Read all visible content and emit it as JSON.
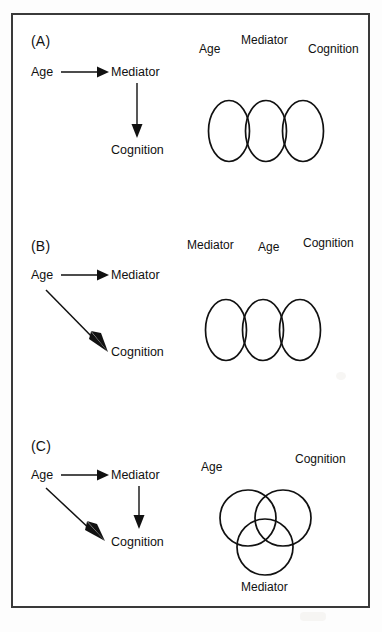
{
  "figure": {
    "panels": [
      {
        "id": "A",
        "label": "(A)",
        "path_diagram": {
          "nodes": {
            "age": "Age",
            "mediator": "Mediator",
            "cognition": "Cognition"
          },
          "arrows": [
            {
              "from": "Age",
              "to": "Mediator",
              "direction": "horizontal"
            },
            {
              "from": "Mediator",
              "to": "Cognition",
              "direction": "vertical"
            }
          ]
        },
        "venn": {
          "type": "chain-three-circle",
          "labels": [
            "Age",
            "Mediator",
            "Cognition"
          ],
          "overlaps": [
            "Age-Mediator",
            "Mediator-Cognition"
          ]
        }
      },
      {
        "id": "B",
        "label": "(B)",
        "path_diagram": {
          "nodes": {
            "age": "Age",
            "mediator": "Mediator",
            "cognition": "Cognition"
          },
          "arrows": [
            {
              "from": "Age",
              "to": "Mediator",
              "direction": "horizontal"
            },
            {
              "from": "Age",
              "to": "Cognition",
              "direction": "diagonal"
            }
          ]
        },
        "venn": {
          "type": "chain-three-circle",
          "labels": [
            "Mediator",
            "Age",
            "Cognition"
          ],
          "overlaps": [
            "Mediator-Age",
            "Age-Cognition"
          ]
        }
      },
      {
        "id": "C",
        "label": "(C)",
        "path_diagram": {
          "nodes": {
            "age": "Age",
            "mediator": "Mediator",
            "cognition": "Cognition"
          },
          "arrows": [
            {
              "from": "Age",
              "to": "Mediator",
              "direction": "horizontal"
            },
            {
              "from": "Age",
              "to": "Cognition",
              "direction": "diagonal"
            },
            {
              "from": "Mediator",
              "to": "Cognition",
              "direction": "vertical"
            }
          ]
        },
        "venn": {
          "type": "triple-overlap-venn",
          "labels": [
            "Age",
            "Cognition",
            "Mediator"
          ],
          "overlaps": [
            "Age-Cognition",
            "Age-Mediator",
            "Cognition-Mediator",
            "Age-Cognition-Mediator"
          ]
        }
      }
    ],
    "colors": {
      "ink": "#111111",
      "frame": "#3a3a3a",
      "background": "#ffffff"
    }
  }
}
